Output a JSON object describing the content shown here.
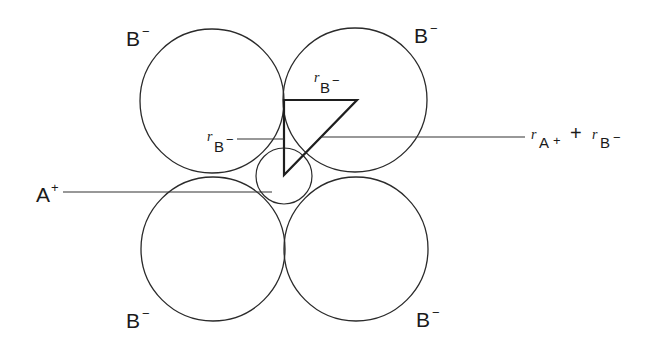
{
  "diagram": {
    "type": "ionic-radius-ratio-geometry",
    "anions": [
      {
        "id": "top-left",
        "label": "B",
        "charge": "−",
        "cx": 212,
        "cy": 101,
        "r": 72
      },
      {
        "id": "top-right",
        "label": "B",
        "charge": "−",
        "cx": 355,
        "cy": 100,
        "r": 72
      },
      {
        "id": "bottom-left",
        "label": "B",
        "charge": "−",
        "cx": 213,
        "cy": 249,
        "r": 72
      },
      {
        "id": "bottom-right",
        "label": "B",
        "charge": "−",
        "cx": 356,
        "cy": 249,
        "r": 72
      }
    ],
    "cation": {
      "label": "A",
      "charge": "+",
      "cx": 284,
      "cy": 176,
      "r": 28
    },
    "triangle": {
      "points": [
        [
          284,
          100
        ],
        [
          357,
          100
        ],
        [
          284,
          175
        ]
      ],
      "legs": {
        "horizontal": {
          "r": "r",
          "sub": "B",
          "sup": "−"
        },
        "vertical": {
          "r": "r",
          "sub": "B",
          "sup": "−"
        },
        "hypotenuse": {
          "term1": {
            "r": "r",
            "sub": "A",
            "sup": "+"
          },
          "operator": "+",
          "term2": {
            "r": "r",
            "sub": "B",
            "sup": "−"
          }
        }
      }
    },
    "labels": {
      "anion": "B",
      "anion_charge": "−",
      "cation": "A",
      "cation_charge": "+",
      "radius_symbol": "r",
      "plus_operator": "+"
    },
    "colors": {
      "stroke": "#2a2a2a",
      "background": "#ffffff"
    }
  }
}
